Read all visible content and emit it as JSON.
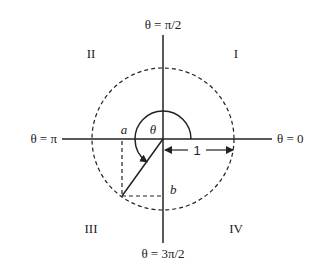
{
  "diagram": {
    "type": "polar-coordinate-unit-circle",
    "axis_labels": {
      "top": "θ = π/2",
      "right": "θ = 0",
      "left": "θ = π",
      "bottom": "θ = 3π/2"
    },
    "quadrants": {
      "q1": "I",
      "q2": "II",
      "q3": "III",
      "q4": "IV"
    },
    "angle_label": "θ",
    "point_labels": {
      "a": "a",
      "b": "b"
    },
    "radius_label": "1",
    "colors": {
      "line": "#222222",
      "background": "#ffffff"
    }
  }
}
